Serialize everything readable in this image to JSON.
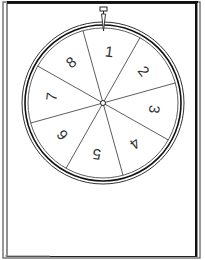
{
  "spinner": {
    "segments": [
      {
        "label": "1"
      },
      {
        "label": "2"
      },
      {
        "label": "3"
      },
      {
        "label": "4"
      },
      {
        "label": "5"
      },
      {
        "label": "6"
      },
      {
        "label": "7"
      },
      {
        "label": "8"
      }
    ],
    "pointer": "pointer-icon",
    "colors": {
      "line": "#1a1a1a",
      "background": "#ffffff",
      "rim": "#111111"
    }
  }
}
